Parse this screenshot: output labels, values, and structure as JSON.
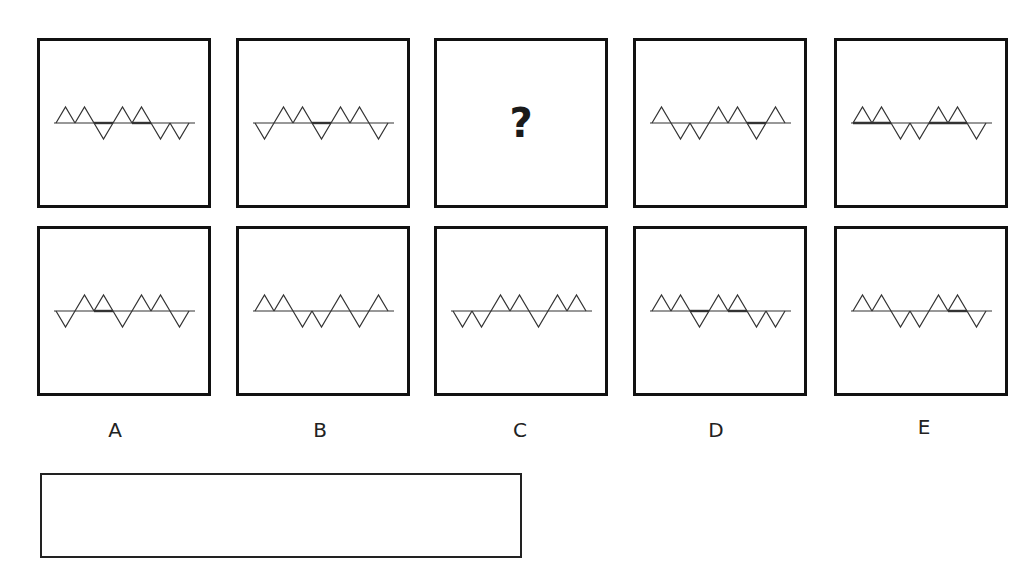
{
  "question": {
    "missing_symbol": "?",
    "sequence": [
      {
        "id": "q1",
        "pattern": [
          "up",
          "up",
          "down",
          "up",
          "up",
          "down",
          "down"
        ],
        "thick_segments": [
          [
            2,
            3
          ],
          [
            4,
            5
          ]
        ]
      },
      {
        "id": "q2",
        "pattern": [
          "down",
          "up",
          "up",
          "down",
          "up",
          "up",
          "down"
        ],
        "thick_segments": [
          [
            3,
            4
          ]
        ]
      },
      {
        "id": "q3",
        "missing": true
      },
      {
        "id": "q4",
        "pattern": [
          "up",
          "down",
          "down",
          "up",
          "up",
          "down",
          "up"
        ],
        "thick_segments": [
          [
            5,
            6
          ]
        ]
      },
      {
        "id": "q5",
        "pattern": [
          "up",
          "up",
          "down",
          "down",
          "up",
          "up",
          "down"
        ],
        "thick_segments": [
          [
            0,
            2
          ],
          [
            4,
            6
          ]
        ]
      }
    ]
  },
  "options": [
    {
      "label": "A",
      "pattern": [
        "down",
        "up",
        "up",
        "down",
        "up",
        "up",
        "down"
      ],
      "thick_segments": [
        [
          2,
          3
        ]
      ]
    },
    {
      "label": "B",
      "pattern": [
        "up",
        "up",
        "down",
        "down",
        "up",
        "down",
        "up"
      ],
      "thick_segments": []
    },
    {
      "label": "C",
      "pattern": [
        "down",
        "down",
        "up",
        "up",
        "down",
        "up",
        "up"
      ],
      "thick_segments": []
    },
    {
      "label": "D",
      "pattern": [
        "up",
        "up",
        "down",
        "up",
        "up",
        "down",
        "down"
      ],
      "thick_segments": [
        [
          2,
          3
        ],
        [
          4,
          5
        ]
      ]
    },
    {
      "label": "E",
      "pattern": [
        "up",
        "up",
        "down",
        "down",
        "up",
        "up",
        "down"
      ],
      "thick_segments": [
        [
          5,
          6
        ]
      ]
    }
  ],
  "answer_box": {
    "value": ""
  },
  "colors": {
    "stroke": "#333333",
    "border": "#111111"
  }
}
